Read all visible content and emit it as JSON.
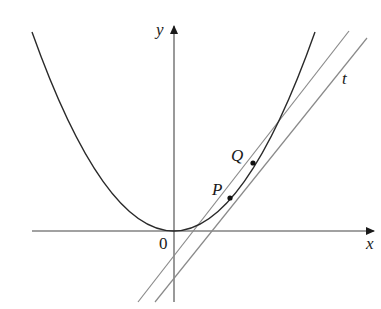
{
  "diagram": {
    "type": "tangent-secant-parabola",
    "colors": {
      "axis": "#444444",
      "curve": "#2a2a2a",
      "secant": "#8a8a8a",
      "tangent": "#8a8a8a",
      "point": "#111111",
      "label": "#1a1a1a"
    },
    "axes": {
      "x_label": "x",
      "y_label": "y",
      "origin_label": "0"
    },
    "curve": {
      "name": "parabola"
    },
    "points": [
      {
        "id": "P",
        "label": "P"
      },
      {
        "id": "Q",
        "label": "Q"
      }
    ],
    "lines": [
      {
        "id": "secant",
        "label": "",
        "through": [
          "P",
          "Q"
        ]
      },
      {
        "id": "tangent",
        "label": "t",
        "tangent_at": "P"
      }
    ]
  }
}
